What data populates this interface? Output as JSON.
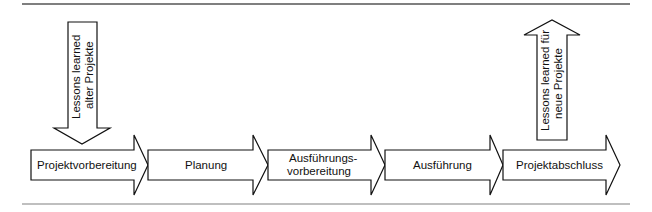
{
  "diagram": {
    "type": "process-flow",
    "phases": [
      {
        "label_lines": [
          "Projektvorbereitung"
        ]
      },
      {
        "label_lines": [
          "Planung"
        ]
      },
      {
        "label_lines": [
          "Ausführungs-",
          "vorbereitung"
        ]
      },
      {
        "label_lines": [
          "Ausführung"
        ]
      },
      {
        "label_lines": [
          "Projektabschluss"
        ]
      }
    ],
    "input_arrow": {
      "direction": "down",
      "target_phase": "Projektvorbereitung",
      "label_lines": [
        "Lessons learned",
        "alter Projekte"
      ]
    },
    "output_arrow": {
      "direction": "up",
      "source_phase": "Projektabschluss",
      "label_lines": [
        "Lessons learned für",
        "neue Projekte"
      ]
    },
    "colors": {
      "stroke": "#111111",
      "fill": "#ffffff",
      "rule": "#555555"
    }
  }
}
